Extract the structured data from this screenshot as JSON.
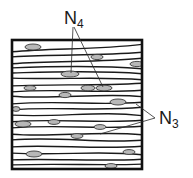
{
  "figure": {
    "labels": {
      "top": {
        "base": "N",
        "subscript": "4"
      },
      "right": {
        "base": "N",
        "subscript": "3"
      }
    },
    "colors": {
      "stroke": "#1a1a1a",
      "nucleus_fill": "#b8b8b8",
      "background": "#ffffff"
    }
  }
}
